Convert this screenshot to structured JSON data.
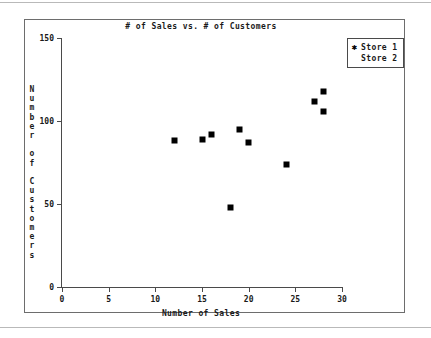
{
  "chart_data": {
    "type": "scatter",
    "title": "# of Sales vs. # of Customers",
    "xlabel": "Number of Sales",
    "ylabel": "Number of Customers",
    "xlim": [
      0,
      30
    ],
    "ylim": [
      0,
      150
    ],
    "xticks": [
      "0",
      "5",
      "10",
      "15",
      "20",
      "25",
      "30"
    ],
    "xtick_values": [
      0,
      5,
      10,
      15,
      20,
      25,
      30
    ],
    "yticks": [
      "0",
      "50",
      "100",
      "150"
    ],
    "ytick_values": [
      0,
      50,
      100,
      150
    ],
    "grid": false,
    "legend_position": "top-right",
    "marker_color": "#000000",
    "axis_color": "#4a4a4a",
    "series": [
      {
        "name": "Store 1",
        "marker": "*",
        "points": [
          {
            "x": 12,
            "y": 88
          },
          {
            "x": 15,
            "y": 89
          },
          {
            "x": 16,
            "y": 92
          },
          {
            "x": 18,
            "y": 48
          },
          {
            "x": 19,
            "y": 95
          },
          {
            "x": 20,
            "y": 87
          },
          {
            "x": 24,
            "y": 74
          },
          {
            "x": 27,
            "y": 112
          },
          {
            "x": 28,
            "y": 118
          },
          {
            "x": 28,
            "y": 106
          }
        ]
      },
      {
        "name": "Store 2",
        "marker": "",
        "points": []
      }
    ]
  },
  "legend": {
    "entries": [
      {
        "marker": "✱",
        "label": "Store 1"
      },
      {
        "marker": "",
        "label": "Store 2"
      }
    ]
  }
}
